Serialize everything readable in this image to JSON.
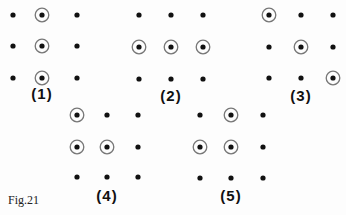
{
  "figure_label": "Fig.21",
  "style": {
    "dot_color": "#111111",
    "ring_color": "#777777"
  },
  "panels": [
    {
      "label": "(1)",
      "label_pos": [
        42,
        95
      ],
      "cols": [
        13,
        42,
        77
      ],
      "rows": [
        15,
        46,
        78
      ],
      "circled": [
        [
          0,
          1
        ],
        [
          1,
          1
        ],
        [
          2,
          1
        ]
      ]
    },
    {
      "label": "(2)",
      "label_pos": [
        171,
        97
      ],
      "cols": [
        139,
        171,
        203
      ],
      "rows": [
        15,
        47,
        79
      ],
      "circled": [
        [
          1,
          0
        ],
        [
          1,
          1
        ],
        [
          1,
          2
        ]
      ]
    },
    {
      "label": "(3)",
      "label_pos": [
        301,
        97
      ],
      "cols": [
        269,
        301,
        333
      ],
      "rows": [
        15,
        47,
        78
      ],
      "circled": [
        [
          0,
          0
        ],
        [
          1,
          1
        ],
        [
          2,
          2
        ]
      ]
    },
    {
      "label": "(4)",
      "label_pos": [
        107,
        197
      ],
      "cols": [
        77,
        107,
        138
      ],
      "rows": [
        115,
        147,
        177
      ],
      "circled": [
        [
          0,
          0
        ],
        [
          1,
          0
        ],
        [
          1,
          1
        ]
      ]
    },
    {
      "label": "(5)",
      "label_pos": [
        231,
        197
      ],
      "cols": [
        200,
        231,
        263
      ],
      "rows": [
        115,
        147,
        178
      ],
      "circled": [
        [
          0,
          1
        ],
        [
          1,
          0
        ],
        [
          1,
          1
        ]
      ]
    }
  ]
}
